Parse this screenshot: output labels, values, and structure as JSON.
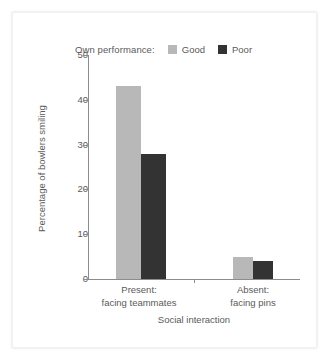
{
  "chart_data": {
    "type": "bar",
    "title": "",
    "subtitle": "",
    "xlabel": "Social interaction",
    "ylabel": "Percentage of bowlers smiling",
    "categories": [
      "Present:\nfacing teammates",
      "Absent:\nfacing pins"
    ],
    "category_lines": [
      [
        "Present:",
        "facing teammates"
      ],
      [
        "Absent:",
        "facing pins"
      ]
    ],
    "series": [
      {
        "name": "Good",
        "values": [
          43,
          5
        ],
        "color": "#b8b8b8"
      },
      {
        "name": "Poor",
        "values": [
          28,
          4
        ],
        "color": "#333333"
      }
    ],
    "ylim": [
      0,
      50
    ],
    "yticks": [
      0,
      10,
      20,
      30,
      40,
      50
    ],
    "ytick_labels": [
      "0",
      "10",
      "20",
      "30",
      "40",
      "50"
    ],
    "grid": false,
    "legend": {
      "position": "top",
      "title": "Own performance:",
      "entries": [
        {
          "label": "Good",
          "color": "#b8b8b8"
        },
        {
          "label": "Poor",
          "color": "#333333"
        }
      ]
    },
    "axis_color": "#8c8c8c",
    "text_color": "#5a5a5a",
    "background": "#ffffff"
  }
}
